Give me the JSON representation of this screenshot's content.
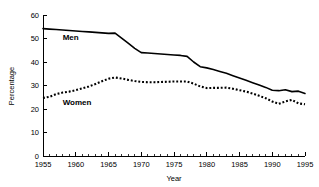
{
  "chart_data": {
    "type": "line",
    "title": "",
    "subtitle": "",
    "xlabel": "Year",
    "ylabel": "Percentage",
    "xlim": [
      1955,
      1995
    ],
    "ylim": [
      0,
      60
    ],
    "grid": false,
    "legend_position": "inline-annotation",
    "x_ticks": [
      1955,
      1960,
      1965,
      1970,
      1975,
      1980,
      1985,
      1990,
      1995
    ],
    "x_tick_labels": [
      "1955",
      "1960",
      "1965",
      "1970",
      "1975",
      "1980",
      "1985",
      "1990",
      "1995"
    ],
    "x_minor_tick_step": 1,
    "y_ticks": [
      0,
      10,
      20,
      30,
      40,
      50,
      60
    ],
    "y_tick_labels": [
      "0",
      "10",
      "20",
      "30",
      "40",
      "50",
      "60"
    ],
    "x": [
      1955,
      1956,
      1957,
      1958,
      1959,
      1960,
      1961,
      1962,
      1963,
      1964,
      1965,
      1966,
      1967,
      1968,
      1969,
      1970,
      1971,
      1972,
      1973,
      1974,
      1975,
      1976,
      1977,
      1978,
      1979,
      1980,
      1981,
      1982,
      1983,
      1984,
      1985,
      1986,
      1987,
      1988,
      1989,
      1990,
      1991,
      1992,
      1993,
      1994,
      1995
    ],
    "series": [
      {
        "name": "Men",
        "style": "solid",
        "color": "#000000",
        "label_x": 1958,
        "label_y": 49.5,
        "values": [
          54.2,
          54.0,
          53.8,
          53.6,
          53.4,
          53.2,
          53.0,
          52.8,
          52.6,
          52.4,
          52.2,
          52.3,
          50.2,
          48.0,
          45.8,
          44.0,
          43.8,
          43.6,
          43.4,
          43.2,
          43.0,
          42.8,
          42.4,
          40.0,
          38.0,
          37.5,
          36.8,
          36.0,
          35.2,
          34.2,
          33.2,
          32.2,
          31.2,
          30.2,
          29.2,
          28.0,
          27.8,
          28.2,
          27.4,
          27.6,
          26.6
        ]
      },
      {
        "name": "Women",
        "style": "dotted",
        "color": "#000000",
        "label_x": 1958,
        "label_y": 21.5,
        "values": [
          24.7,
          25.2,
          26.3,
          27.0,
          27.4,
          28.0,
          28.8,
          29.6,
          30.6,
          31.8,
          32.9,
          33.4,
          33.0,
          32.4,
          31.9,
          31.5,
          31.4,
          31.4,
          31.5,
          31.6,
          31.7,
          31.7,
          31.7,
          30.8,
          29.6,
          28.9,
          29.0,
          29.0,
          29.1,
          28.6,
          28.0,
          27.4,
          26.6,
          25.6,
          24.6,
          23.2,
          22.2,
          23.2,
          23.9,
          22.4,
          22.0
        ]
      }
    ]
  }
}
